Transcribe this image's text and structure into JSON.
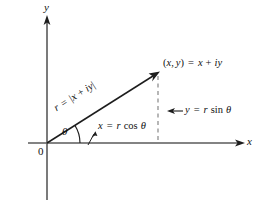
{
  "figure": {
    "background_color": "#ffffff",
    "line_color": "#2b2b2b",
    "axis_color": "#555555",
    "dash_color": "#777777"
  },
  "axes": {
    "x_label": "x",
    "y_label": "y",
    "origin_label": "0",
    "x_axis": {
      "start": [
        28,
        143
      ],
      "end": [
        243,
        143
      ]
    },
    "y_axis": {
      "start": [
        47,
        200
      ],
      "end": [
        47,
        18
      ]
    }
  },
  "vector": {
    "from": [
      47,
      143
    ],
    "to": [
      158,
      73
    ],
    "angle_degrees": 32.2,
    "modulus_label": {
      "text": "r = |x + iy|",
      "parts": {
        "r": "r",
        "equals": "=",
        "bar_open": "|",
        "x": "x",
        "plus": "+",
        "iy": "iy",
        "bar_close": "|"
      }
    }
  },
  "angle": {
    "symbol": "θ",
    "arc_radius": 26
  },
  "point": {
    "label": "(x, y) = x + iy",
    "parts": {
      "open_paren": "(",
      "x": "x",
      "comma": ",",
      "y": "y",
      "close_paren": ")",
      "equals": "=",
      "x2": "x",
      "plus": "+",
      "i": "i",
      "y2": "y"
    }
  },
  "components": {
    "horizontal": {
      "label": "x = r cos θ",
      "parts": {
        "x": "x",
        "equals": "=",
        "r": "r",
        "fn": "cos",
        "theta": "θ"
      }
    },
    "vertical": {
      "label": "y = r sin θ",
      "parts": {
        "y": "y",
        "equals": "=",
        "r": "r",
        "fn": "sin",
        "theta": "θ"
      }
    }
  },
  "dashed_line": {
    "from": [
      158,
      74
    ],
    "to": [
      158,
      143
    ]
  }
}
